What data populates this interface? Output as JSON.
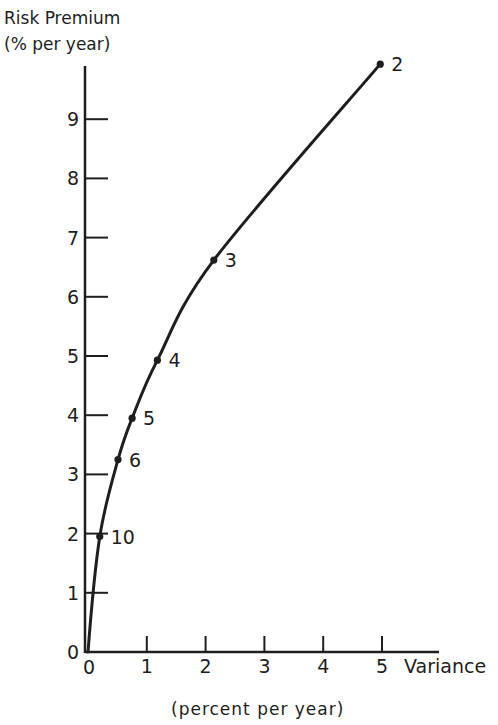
{
  "chart_data": {
    "type": "line",
    "title": "",
    "ylabel": "Risk Premium",
    "ylabel_units": "(% per year)",
    "xlabel": "Variance",
    "xlabel_units": "(percent per year)",
    "xlim": [
      0,
      5
    ],
    "ylim": [
      0,
      10
    ],
    "x_ticks": [
      "0",
      "1",
      "2",
      "3",
      "4",
      "5"
    ],
    "y_ticks": [
      "0",
      "1",
      "2",
      "3",
      "4",
      "5",
      "6",
      "7",
      "8",
      "9"
    ],
    "grid": false,
    "legend": null,
    "series": [
      {
        "name": "risk premium vs variance",
        "points": [
          {
            "label": "10",
            "x": 0.2,
            "y": 1.95
          },
          {
            "label": "6",
            "x": 0.51,
            "y": 3.25
          },
          {
            "label": "5",
            "x": 0.75,
            "y": 3.95
          },
          {
            "label": "4",
            "x": 1.18,
            "y": 4.93
          },
          {
            "label": "3",
            "x": 2.14,
            "y": 6.62
          },
          {
            "label": "2",
            "x": 4.97,
            "y": 9.93
          }
        ]
      }
    ],
    "annotations": [
      "2",
      "3",
      "4",
      "5",
      "6",
      "10"
    ],
    "colors": {
      "ink": "#1e1e1e",
      "background": "#ffffff"
    }
  },
  "axes": {
    "y_title_line1": "Risk Premium",
    "y_title_line2": "(% per year)",
    "x_title": "Variance",
    "x_units": "(percent per year)",
    "y_zero_label": "0",
    "x_zero_label": "0"
  }
}
